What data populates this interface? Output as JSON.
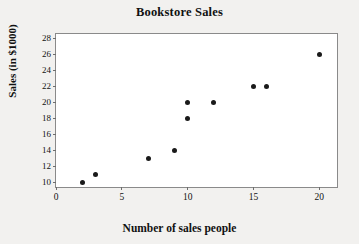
{
  "chart_data": {
    "type": "scatter",
    "title": "Bookstore Sales",
    "xlabel": "Number of sales people",
    "ylabel": "Sales (in $1000)",
    "xlim": [
      0,
      21.5
    ],
    "ylim": [
      9.2,
      28.6
    ],
    "grid": false,
    "legend": null,
    "xticks": [
      0,
      5,
      10,
      15,
      20
    ],
    "xtick_labels": [
      "0",
      "5",
      "10",
      "15",
      "20"
    ],
    "yticks": [
      10,
      12,
      14,
      16,
      18,
      20,
      22,
      24,
      26,
      28
    ],
    "ytick_labels": [
      "10",
      "12",
      "14",
      "16",
      "18",
      "20",
      "22",
      "24",
      "26",
      "28"
    ],
    "marker": "filled-circle",
    "marker_color": "#1a1a1a",
    "points": [
      {
        "x": 2,
        "y": 10
      },
      {
        "x": 3,
        "y": 11
      },
      {
        "x": 7,
        "y": 13
      },
      {
        "x": 9,
        "y": 14
      },
      {
        "x": 10,
        "y": 18
      },
      {
        "x": 10,
        "y": 20
      },
      {
        "x": 12,
        "y": 20
      },
      {
        "x": 15,
        "y": 22
      },
      {
        "x": 16,
        "y": 22
      },
      {
        "x": 20,
        "y": 26
      }
    ]
  },
  "colors": {
    "page_background": "#f2f1ef",
    "plot_background": "#ffffff",
    "frame": "#8a8a8a",
    "text": "#111111",
    "marker": "#1a1a1a"
  }
}
